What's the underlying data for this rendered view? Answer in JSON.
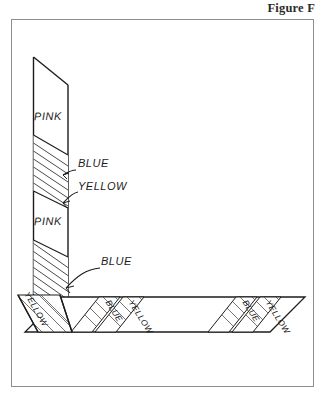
{
  "figure": {
    "title": "Figure F",
    "background_color": "#ffffff",
    "frame_color": "#8d8d92",
    "ink_color": "#1c1c1c"
  },
  "wall_panel": {
    "name": "vertical-wall-panel",
    "bands": [
      {
        "id": "wall-pink-upper",
        "label": "PINK",
        "kind": "plain"
      },
      {
        "id": "wall-hatch-upper",
        "label": "",
        "kind": "hatched"
      },
      {
        "id": "wall-pink-lower",
        "label": "PINK",
        "kind": "plain"
      },
      {
        "id": "wall-hatch-lower",
        "label": "",
        "kind": "hatched"
      }
    ],
    "labels": {
      "pink_upper": "PINK",
      "pink_lower": "PINK",
      "blue_upper": "BLUE",
      "yellow_upper": "YELLOW",
      "blue_lower": "BLUE"
    }
  },
  "floor_panel": {
    "name": "horizontal-floor-panel",
    "labels": {
      "yellow_corner": "YELLOW",
      "blue_near": "BLUE",
      "yellow_near": "YELLOW",
      "blue_far": "BLUE",
      "yellow_far": "YELLOW"
    }
  },
  "annotations": [
    {
      "id": "callout-blue-upper",
      "text": "BLUE",
      "target": "wall-hatch-upper",
      "has_arrow": true
    },
    {
      "id": "callout-yellow-upper",
      "text": "YELLOW",
      "target": "wall-hatch-upper",
      "has_arrow": true
    },
    {
      "id": "callout-blue-lower",
      "text": "BLUE",
      "target": "wall-hatch-lower",
      "has_arrow": true
    }
  ]
}
